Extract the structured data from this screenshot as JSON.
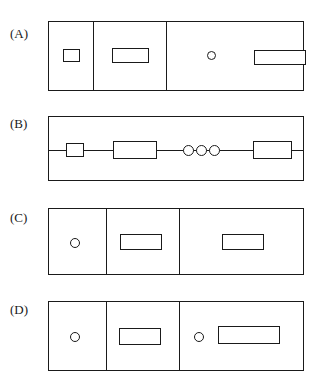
{
  "figure": {
    "background_color": "#ffffff",
    "stroke_color": "#1a1a1a",
    "panels": [
      {
        "id": "panel-a",
        "label": "(A)",
        "label_x": 10,
        "label_y": 27,
        "box": {
          "x": 48,
          "y": 21,
          "w": 256,
          "h": 70
        },
        "dividers": [
          92,
          165
        ],
        "shapes": [
          {
            "kind": "rect",
            "x": 63,
            "y": 49,
            "w": 17,
            "h": 13
          },
          {
            "kind": "rect",
            "x": 112,
            "y": 48,
            "w": 37,
            "h": 15
          },
          {
            "kind": "circle",
            "x": 207,
            "y": 51,
            "w": 9,
            "h": 9
          },
          {
            "kind": "rect",
            "x": 254,
            "y": 50,
            "w": 52,
            "h": 15
          }
        ]
      },
      {
        "id": "panel-b",
        "label": "(B)",
        "label_x": 10,
        "label_y": 117,
        "box": {
          "x": 48,
          "y": 116,
          "w": 256,
          "h": 65
        },
        "dividers": [],
        "chain_line": {
          "x": 48,
          "y": 150,
          "w": 256
        },
        "shapes": [
          {
            "kind": "rect",
            "x": 66,
            "y": 143,
            "w": 18,
            "h": 14
          },
          {
            "kind": "rect",
            "x": 113,
            "y": 141,
            "w": 44,
            "h": 18
          },
          {
            "kind": "circle",
            "x": 183,
            "y": 145,
            "w": 11,
            "h": 11
          },
          {
            "kind": "circle",
            "x": 196,
            "y": 145,
            "w": 11,
            "h": 11
          },
          {
            "kind": "circle",
            "x": 209,
            "y": 145,
            "w": 11,
            "h": 11
          },
          {
            "kind": "rect",
            "x": 253,
            "y": 141,
            "w": 39,
            "h": 18
          }
        ]
      },
      {
        "id": "panel-c",
        "label": "(C)",
        "label_x": 10,
        "label_y": 211,
        "box": {
          "x": 48,
          "y": 208,
          "w": 256,
          "h": 67
        },
        "dividers": [
          105,
          178
        ],
        "shapes": [
          {
            "kind": "circle",
            "x": 70,
            "y": 238,
            "w": 10,
            "h": 10
          },
          {
            "kind": "rect",
            "x": 120,
            "y": 234,
            "w": 42,
            "h": 16
          },
          {
            "kind": "rect",
            "x": 222,
            "y": 234,
            "w": 42,
            "h": 16
          }
        ]
      },
      {
        "id": "panel-d",
        "label": "(D)",
        "label_x": 10,
        "label_y": 303,
        "box": {
          "x": 48,
          "y": 301,
          "w": 256,
          "h": 70
        },
        "dividers": [
          105,
          178
        ],
        "shapes": [
          {
            "kind": "circle",
            "x": 70,
            "y": 332,
            "w": 10,
            "h": 10
          },
          {
            "kind": "rect",
            "x": 119,
            "y": 328,
            "w": 42,
            "h": 17
          },
          {
            "kind": "circle",
            "x": 194,
            "y": 332,
            "w": 10,
            "h": 10
          },
          {
            "kind": "rect",
            "x": 218,
            "y": 326,
            "w": 62,
            "h": 18
          }
        ]
      }
    ]
  }
}
